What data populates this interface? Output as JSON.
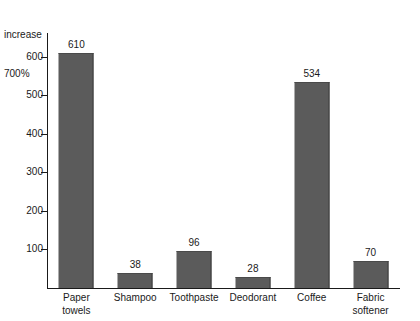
{
  "chart_data": {
    "type": "bar",
    "title": "",
    "subtitle": "",
    "xlabel": "",
    "ylabel": "increase 700%",
    "ylabel_lines": [
      "increase",
      "700%"
    ],
    "categories": [
      "Paper towels",
      "Shampoo",
      "Toothpaste",
      "Deodorant",
      "Coffee",
      "Fabric softener"
    ],
    "category_lines": [
      [
        "Paper",
        "towels"
      ],
      [
        "Shampoo",
        ""
      ],
      [
        "Toothpaste",
        ""
      ],
      [
        "Deodorant",
        ""
      ],
      [
        "Coffee",
        ""
      ],
      [
        "Fabric",
        "softener"
      ]
    ],
    "values": [
      610,
      38,
      96,
      28,
      534,
      70
    ],
    "value_labels": [
      "610",
      "38",
      "96",
      "28",
      "534",
      "70"
    ],
    "ylim": [
      0,
      662
    ],
    "yticks": [
      100,
      200,
      300,
      400,
      500,
      600
    ],
    "ytick_labels": [
      "100",
      "200",
      "300",
      "400",
      "500",
      "600"
    ],
    "grid": false,
    "legend": false,
    "bar_color": "#5b5b5b",
    "axis_color": "#1a1a1a",
    "background_color": "#ffffff"
  }
}
